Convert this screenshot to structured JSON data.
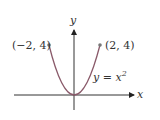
{
  "diagram": {
    "function_label": "y = x",
    "function_exponent": "2",
    "x_axis_label": "x",
    "y_axis_label": "y",
    "points": [
      {
        "label": "(−2, 4)",
        "x": -2,
        "y": 4
      },
      {
        "label": "(2, 4)",
        "x": 2,
        "y": 4
      }
    ],
    "colors": {
      "curve": "#8a5a6a",
      "axes": "#333333",
      "point": "#777777"
    }
  }
}
